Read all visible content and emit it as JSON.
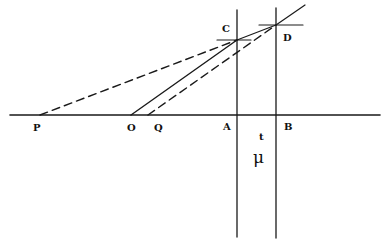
{
  "diagram": {
    "type": "geometric construction",
    "colors": {
      "ink": "#1a1a1a",
      "background": "#ffffff"
    },
    "points": {
      "P": {
        "label": "P",
        "x": 40,
        "y": 115
      },
      "O": {
        "label": "O",
        "x": 131,
        "y": 115
      },
      "Q": {
        "label": "Q",
        "x": 148,
        "y": 115
      },
      "A": {
        "label": "A",
        "x": 237,
        "y": 115
      },
      "B": {
        "label": "B",
        "x": 276,
        "y": 115
      },
      "C": {
        "label": "C",
        "x": 237,
        "y": 40
      },
      "D": {
        "label": "D",
        "x": 276,
        "y": 25
      }
    },
    "labels": {
      "P": "P",
      "O": "O",
      "Q": "Q",
      "A": "A",
      "B": "B",
      "C": "C",
      "D": "D",
      "t": "t",
      "mu": "μ"
    },
    "lines": [
      {
        "name": "base-line",
        "style": "solid",
        "from": [
          10,
          115
        ],
        "to": [
          380,
          115
        ]
      },
      {
        "name": "vertical-a",
        "style": "solid",
        "from": [
          237,
          10
        ],
        "to": [
          237,
          237
        ]
      },
      {
        "name": "vertical-b",
        "style": "solid",
        "from": [
          276,
          8
        ],
        "to": [
          276,
          238
        ]
      },
      {
        "name": "crosshair-c",
        "style": "solid",
        "from": [
          217,
          40
        ],
        "to": [
          251,
          40
        ]
      },
      {
        "name": "crosshair-d",
        "style": "solid",
        "from": [
          259,
          25
        ],
        "to": [
          303,
          25
        ]
      },
      {
        "name": "ray-o-c-d",
        "style": "solid",
        "from": [
          131,
          115
        ],
        "to": [
          305,
          5
        ]
      },
      {
        "name": "dashed-p-c",
        "style": "dashed",
        "from": [
          40,
          115
        ],
        "to": [
          237,
          40
        ]
      },
      {
        "name": "dashed-q-d",
        "style": "dashed",
        "from": [
          148,
          115
        ],
        "to": [
          276,
          25
        ]
      }
    ]
  }
}
